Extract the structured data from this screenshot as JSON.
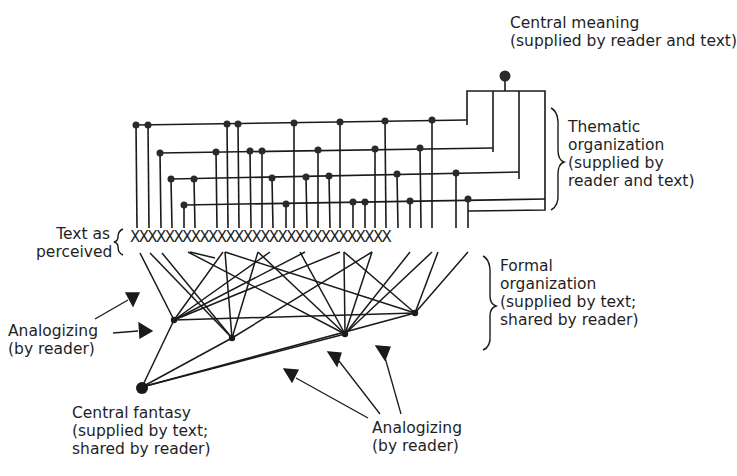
{
  "diagram": {
    "central_meaning": {
      "title": "Central meaning",
      "subtitle": "(supplied by reader and text)"
    },
    "thematic": {
      "line1": "Thematic",
      "line2": "organization",
      "line3": "(supplied by",
      "line4": "reader and text)"
    },
    "text_perceived": {
      "line1": "Text as",
      "line2": "perceived",
      "x_row": "XXXXXXXXXXXXXXXXXXXXXXXXXXXXXX"
    },
    "formal": {
      "line1": "Formal",
      "line2": "organization",
      "line3": "(supplied by text;",
      "line4": "shared by reader)"
    },
    "analogizing_left": {
      "line1": "Analogizing",
      "line2": "(by reader)"
    },
    "central_fantasy": {
      "line1": "Central fantasy",
      "line2": "(supplied by text;",
      "line3": "shared by reader)"
    },
    "analogizing_bottom": {
      "line1": "Analogizing",
      "line2": "(by reader)"
    },
    "colors": {
      "ink": "#1a1a1a",
      "background": "#ffffff"
    }
  }
}
